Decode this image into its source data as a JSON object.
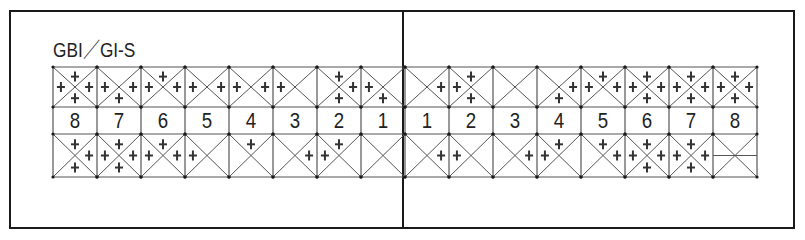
{
  "title": "GBI／GI-S",
  "layout": {
    "grid_left": 53,
    "tooth_width": 44,
    "upper_row": {
      "top": 67,
      "bottom": 107
    },
    "number_row": {
      "top": 107,
      "bottom": 134
    },
    "lower_row": {
      "top": 134,
      "bottom": 177
    }
  },
  "colors": {
    "line": "#1a1a1a",
    "grid": "#555555",
    "mark": "#333333"
  },
  "tooth_numbers": [
    "8",
    "7",
    "6",
    "5",
    "4",
    "3",
    "2",
    "1",
    "1",
    "2",
    "3",
    "4",
    "5",
    "6",
    "7",
    "8"
  ],
  "upper": [
    {
      "quadrant": "upper-right",
      "tooth": "8",
      "marks": [
        "top",
        "left",
        "right",
        "bottom"
      ]
    },
    {
      "quadrant": "upper-right",
      "tooth": "7",
      "marks": [
        "left",
        "right",
        "bottom"
      ]
    },
    {
      "quadrant": "upper-right",
      "tooth": "6",
      "marks": [
        "top",
        "left",
        "right"
      ]
    },
    {
      "quadrant": "upper-right",
      "tooth": "5",
      "marks": [
        "left",
        "right"
      ]
    },
    {
      "quadrant": "upper-right",
      "tooth": "4",
      "marks": [
        "left",
        "right"
      ]
    },
    {
      "quadrant": "upper-right",
      "tooth": "3",
      "marks": [
        "left"
      ]
    },
    {
      "quadrant": "upper-right",
      "tooth": "2",
      "marks": [
        "top",
        "right",
        "bottom"
      ]
    },
    {
      "quadrant": "upper-right",
      "tooth": "1",
      "marks": [
        "left",
        "bottom"
      ]
    },
    {
      "quadrant": "upper-left",
      "tooth": "1",
      "marks": [
        "right"
      ]
    },
    {
      "quadrant": "upper-left",
      "tooth": "2",
      "marks": [
        "top",
        "left",
        "bottom"
      ]
    },
    {
      "quadrant": "upper-left",
      "tooth": "3",
      "marks": []
    },
    {
      "quadrant": "upper-left",
      "tooth": "4",
      "marks": [
        "right",
        "bottom"
      ]
    },
    {
      "quadrant": "upper-left",
      "tooth": "5",
      "marks": [
        "top",
        "left",
        "right"
      ]
    },
    {
      "quadrant": "upper-left",
      "tooth": "6",
      "marks": [
        "top",
        "left",
        "right",
        "bottom"
      ]
    },
    {
      "quadrant": "upper-left",
      "tooth": "7",
      "marks": [
        "top",
        "left",
        "right",
        "bottom"
      ]
    },
    {
      "quadrant": "upper-left",
      "tooth": "8",
      "marks": [
        "top",
        "left",
        "right",
        "bottom"
      ]
    }
  ],
  "lower": [
    {
      "quadrant": "lower-right",
      "tooth": "8",
      "marks": [
        "top",
        "right",
        "bottom"
      ]
    },
    {
      "quadrant": "lower-right",
      "tooth": "7",
      "marks": [
        "top",
        "left",
        "right",
        "bottom"
      ]
    },
    {
      "quadrant": "lower-right",
      "tooth": "6",
      "marks": [
        "top",
        "left",
        "right"
      ]
    },
    {
      "quadrant": "lower-right",
      "tooth": "5",
      "marks": [
        "left"
      ]
    },
    {
      "quadrant": "lower-right",
      "tooth": "4",
      "marks": [
        "top"
      ]
    },
    {
      "quadrant": "lower-right",
      "tooth": "3",
      "marks": [
        "right"
      ]
    },
    {
      "quadrant": "lower-right",
      "tooth": "2",
      "marks": [
        "top",
        "left"
      ]
    },
    {
      "quadrant": "lower-right",
      "tooth": "1",
      "marks": []
    },
    {
      "quadrant": "lower-left",
      "tooth": "1",
      "marks": [
        "right"
      ]
    },
    {
      "quadrant": "lower-left",
      "tooth": "2",
      "marks": [
        "left"
      ]
    },
    {
      "quadrant": "lower-left",
      "tooth": "3",
      "marks": [
        "right"
      ]
    },
    {
      "quadrant": "lower-left",
      "tooth": "4",
      "marks": [
        "top",
        "left"
      ]
    },
    {
      "quadrant": "lower-left",
      "tooth": "5",
      "marks": [
        "top",
        "right"
      ]
    },
    {
      "quadrant": "lower-left",
      "tooth": "6",
      "marks": [
        "top",
        "left",
        "right",
        "bottom"
      ]
    },
    {
      "quadrant": "lower-left",
      "tooth": "7",
      "marks": [
        "top",
        "left",
        "right",
        "bottom"
      ]
    },
    {
      "quadrant": "lower-left",
      "tooth": "8",
      "marks": [],
      "missing": true
    }
  ]
}
